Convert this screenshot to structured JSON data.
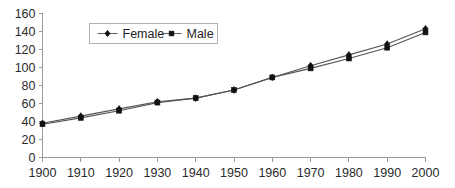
{
  "chart_data": {
    "type": "line",
    "title": "",
    "subtitle": "",
    "xlabel": "",
    "ylabel": "",
    "x": [
      1900,
      1910,
      1920,
      1930,
      1940,
      1950,
      1960,
      1970,
      1980,
      1990,
      2000
    ],
    "x_tick_labels": [
      "1900",
      "1910",
      "1920",
      "1930",
      "1940",
      "1950",
      "1960",
      "1970",
      "1980",
      "1990",
      "2000"
    ],
    "y_tick_labels": [
      "0",
      "20",
      "40",
      "60",
      "80",
      "100",
      "120",
      "140",
      "160"
    ],
    "y_ticks": [
      0,
      20,
      40,
      60,
      80,
      100,
      120,
      140,
      160
    ],
    "xlim": [
      1900,
      2000
    ],
    "ylim": [
      0,
      160
    ],
    "grid": false,
    "legend_position": "upper left",
    "series": [
      {
        "name": "Female",
        "marker": "diamond",
        "color": "#111111",
        "values": [
          38,
          46,
          54,
          62,
          66,
          75,
          89,
          102,
          114,
          126,
          143
        ]
      },
      {
        "name": "Male",
        "marker": "square",
        "color": "#111111",
        "values": [
          37,
          44,
          52,
          61,
          66,
          75,
          89,
          99,
          110,
          122,
          139
        ]
      }
    ]
  },
  "legend": {
    "entries": [
      {
        "label": "Female",
        "marker": "diamond-marker-icon"
      },
      {
        "label": "Male",
        "marker": "square-marker-icon"
      }
    ]
  },
  "colors": {
    "background": "#ffffff",
    "axis": "#9a9a9a",
    "line": "#555555",
    "marker": "#111111",
    "text": "#2b2b2b",
    "legend_border": "#b0b0b0"
  }
}
